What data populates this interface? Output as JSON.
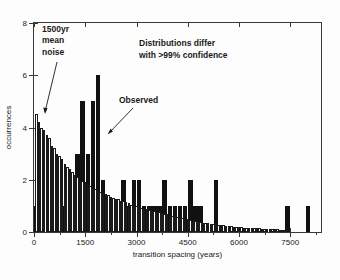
{
  "figure": {
    "background_color": "#fdfdfd",
    "frame_color": "#3a3a3a"
  },
  "annotations": {
    "noise_label": "1500yr\nmean\nnoise",
    "observed_label": "Observed",
    "confidence_label": "Distributions differ\nwith >99% confidence"
  },
  "axis": {
    "ylabel": "occurrences",
    "xlabel": "transition spacing (years)",
    "yticks": [
      0,
      2,
      4,
      6,
      8
    ],
    "xticks": [
      0,
      1500,
      3000,
      4500,
      6000,
      7500
    ]
  },
  "chart_data": {
    "type": "bar",
    "title": "",
    "xlabel": "transition spacing (years)",
    "ylabel": "occurrences",
    "xlim": [
      0,
      8400
    ],
    "ylim": [
      0,
      8
    ],
    "grid": false,
    "legend": "annotation",
    "bin_width": 150,
    "series": [
      {
        "name": "Observed",
        "color": "#111111",
        "style": "solid-filled",
        "x": [
          75,
          225,
          375,
          525,
          675,
          825,
          975,
          1125,
          1275,
          1425,
          1575,
          1725,
          1875,
          2025,
          2175,
          2325,
          2475,
          2625,
          2775,
          2925,
          3075,
          3225,
          3375,
          3525,
          3675,
          3825,
          3975,
          4125,
          4275,
          4425,
          4575,
          4725,
          4875,
          5025,
          5175,
          5325,
          5475,
          5625,
          5775,
          5925,
          6075,
          6225,
          6375,
          6525,
          6675,
          6825,
          6975,
          7125,
          7275,
          7425,
          7575,
          7725,
          7875,
          8025,
          8175
        ],
        "values": [
          1,
          1,
          0,
          0,
          0,
          1,
          1,
          2,
          3,
          5,
          3,
          5,
          6,
          2,
          1,
          1,
          1,
          2,
          1,
          2,
          2,
          1,
          1,
          1,
          1,
          2,
          1,
          1,
          1,
          1,
          2,
          1,
          1,
          0,
          0,
          2,
          0,
          0,
          0,
          0,
          0,
          0,
          0,
          0,
          0,
          0,
          0,
          0,
          0,
          1,
          0,
          0,
          0,
          1,
          0
        ]
      },
      {
        "name": "1500yr mean noise",
        "color": "#ffffff",
        "edge_color": "#1a1a1a",
        "style": "open-outline",
        "x": [
          75,
          150,
          225,
          300,
          375,
          450,
          525,
          600,
          675,
          750,
          825,
          900,
          975,
          1050,
          1125,
          1200,
          1275,
          1350,
          1425,
          1500,
          1575,
          1650,
          1725,
          1800,
          1875,
          1950,
          2025,
          2100,
          2175,
          2250,
          2325,
          2400,
          2475,
          2550,
          2625,
          2700,
          2775,
          2850,
          2925,
          3000,
          3075,
          3150,
          3225,
          3300,
          3375,
          3450,
          3525,
          3600,
          3675,
          3750,
          3825,
          3900,
          3975,
          4050,
          4125,
          4200,
          4275,
          4350,
          4425,
          4500,
          4575,
          4650,
          4725,
          4800,
          4875,
          4950,
          5025,
          5100,
          5175,
          5250,
          5325,
          5400,
          5475,
          5550,
          5625,
          5700,
          5775,
          5850,
          5925,
          6000,
          6075,
          6150,
          6225,
          6300,
          6375,
          6450,
          6525,
          6600,
          6675,
          6750,
          6825,
          6900,
          6975,
          7050,
          7125,
          7200,
          7275,
          7350,
          7425
        ],
        "values": [
          4.5,
          4.2,
          4.0,
          3.9,
          3.7,
          3.6,
          3.3,
          3.2,
          3.0,
          2.9,
          2.8,
          2.6,
          2.5,
          2.4,
          2.3,
          2.2,
          2.1,
          2.0,
          1.95,
          1.9,
          1.8,
          1.75,
          1.7,
          1.65,
          1.6,
          1.55,
          1.5,
          1.45,
          1.4,
          1.35,
          1.3,
          1.28,
          1.25,
          1.2,
          1.18,
          1.15,
          1.1,
          1.05,
          1.0,
          0.98,
          0.95,
          0.92,
          0.9,
          0.88,
          0.85,
          0.82,
          0.8,
          0.78,
          0.75,
          0.72,
          0.7,
          0.68,
          0.65,
          0.62,
          0.6,
          0.58,
          0.55,
          0.52,
          0.5,
          0.48,
          0.45,
          0.43,
          0.42,
          0.4,
          0.38,
          0.36,
          0.35,
          0.33,
          0.32,
          0.3,
          0.29,
          0.28,
          0.26,
          0.25,
          0.24,
          0.23,
          0.22,
          0.21,
          0.2,
          0.19,
          0.18,
          0.17,
          0.16,
          0.155,
          0.15,
          0.145,
          0.14,
          0.135,
          0.13,
          0.125,
          0.12,
          0.115,
          0.11,
          0.105,
          0.1,
          0.095,
          0.09,
          0.085,
          0.08
        ]
      }
    ]
  }
}
